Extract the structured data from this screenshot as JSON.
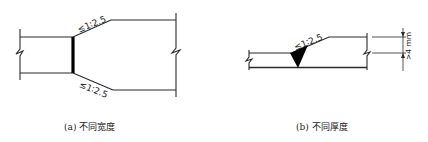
{
  "figure": {
    "panels": [
      {
        "id": "a",
        "caption": "(a) 不同宽度",
        "slope_labels": [
          "≤1∶2.5",
          "≤1∶2.5"
        ],
        "description": "Butt joint between plates of different width, taper slope on both edges"
      },
      {
        "id": "b",
        "caption": "(b) 不同厚度",
        "slope_labels": [
          "≤1∶2.5"
        ],
        "dimension_label": ">4 mm",
        "description": "Butt joint between plates of different thickness, taper slope on top face, thickness difference dimension"
      }
    ]
  },
  "colors": {
    "line": "#2a2a2a",
    "weld": "#000000",
    "background": "#ffffff"
  }
}
